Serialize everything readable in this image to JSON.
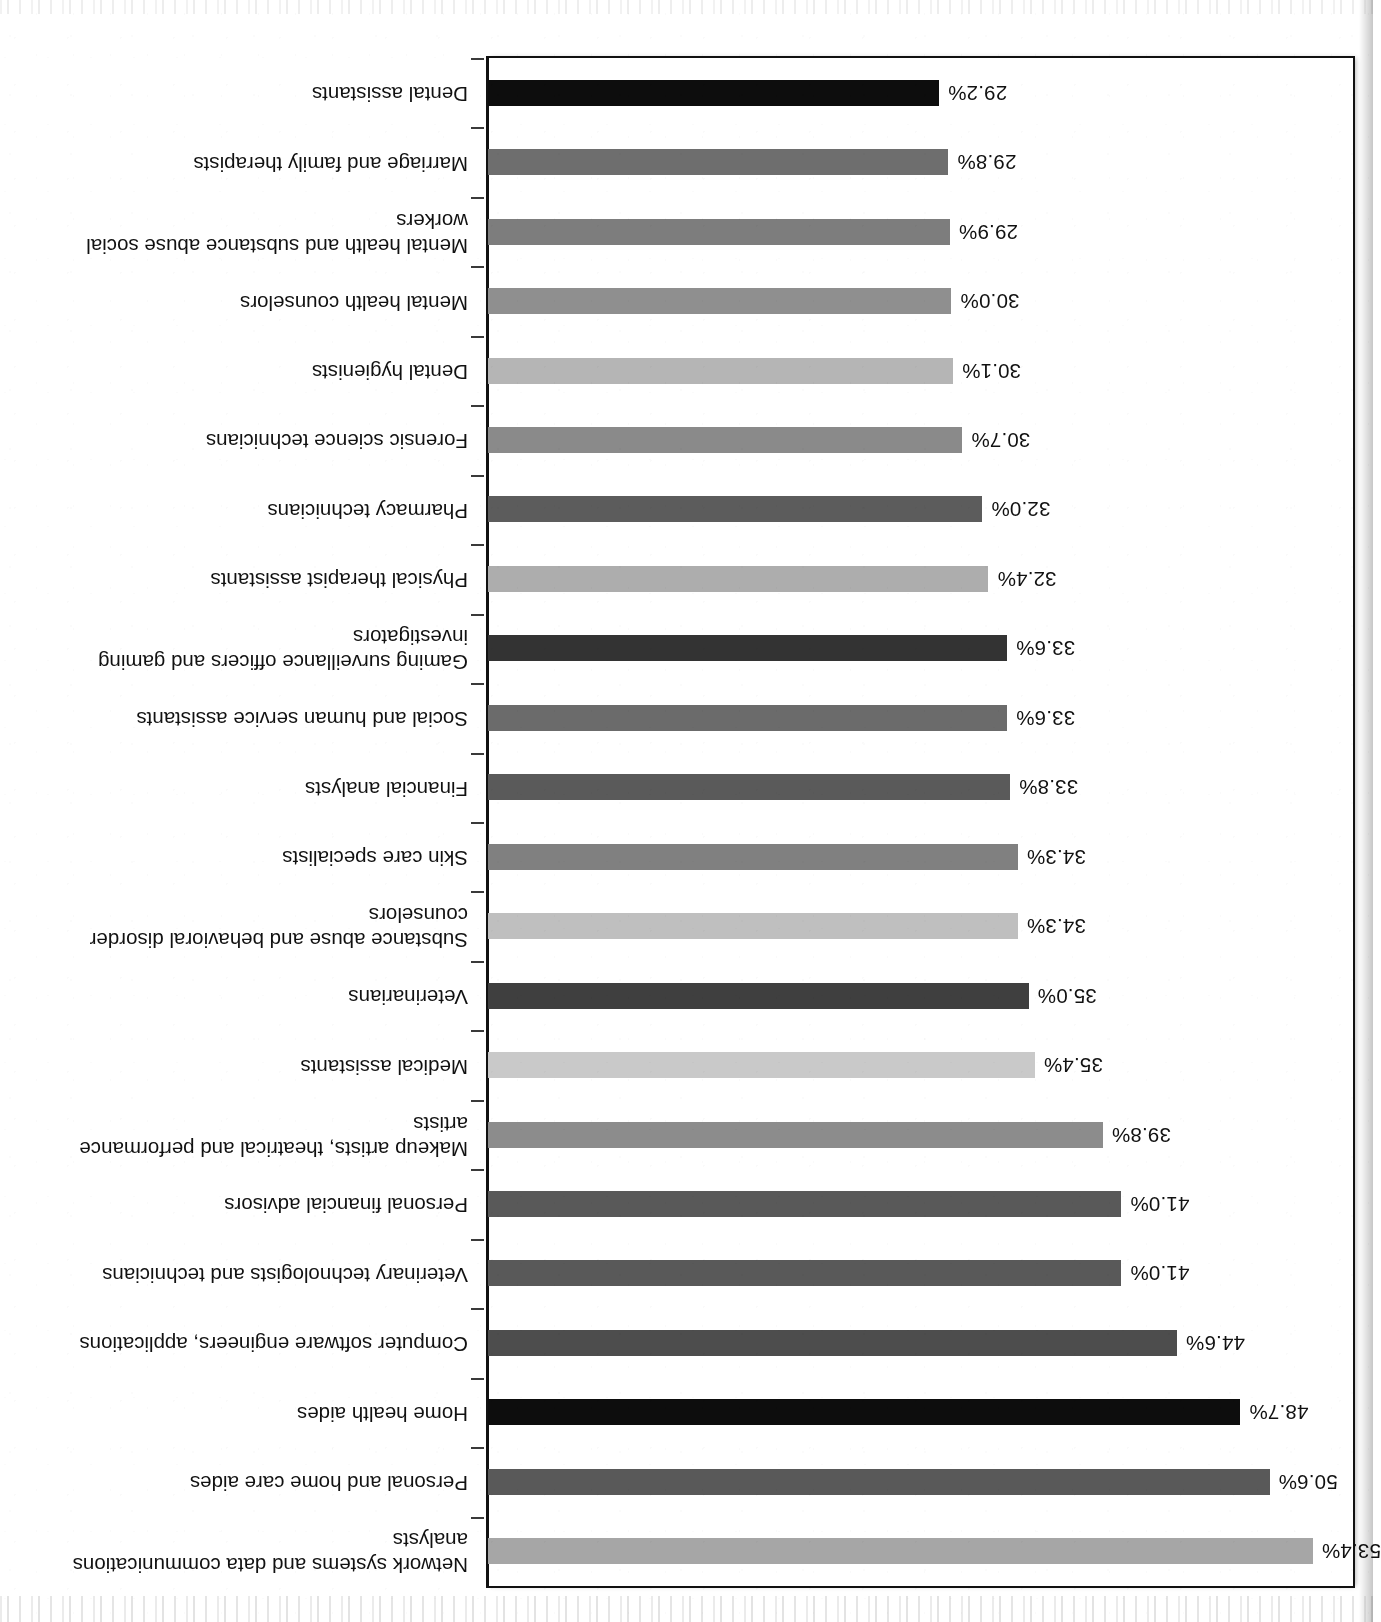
{
  "page": {
    "orientation_note": "upside-down-scan",
    "background": "#ffffff",
    "frame_color": "#111111",
    "axis_color": "#111111"
  },
  "chart_data": {
    "type": "bar",
    "orientation": "horizontal",
    "title": "",
    "subtitle": "",
    "xlabel": "",
    "ylabel": "",
    "xlim": [
      0,
      56
    ],
    "grid": false,
    "legend": "none",
    "value_suffix": "%",
    "categories": [
      "Network systems and data communications\nanalysts",
      "Personal and home care aides",
      "Home health aides",
      "Computer software engineers, applications",
      "Veterinary technologists and technicians",
      "Personal financial advisors",
      "Makeup artists, theatrical and performance\nartists",
      "Medical assistants",
      "Veterinarians",
      "Substance abuse and behavioral disorder\ncounselors",
      "Skin care specialists",
      "Financial analysts",
      "Social and human service assistants",
      "Gaming surveillance officers and gaming\ninvestigators",
      "Physical therapist assistants",
      "Pharmacy technicians",
      "Forensic science technicians",
      "Dental hygienists",
      "Mental health counselors",
      "Mental health and substance abuse social\nworkers",
      "Marriage and family therapists",
      "Dental assistants"
    ],
    "values": [
      53.4,
      50.6,
      48.7,
      44.6,
      41.0,
      41.0,
      39.8,
      35.4,
      35.0,
      34.3,
      34.3,
      33.8,
      33.6,
      33.6,
      32.4,
      32.0,
      30.7,
      30.1,
      30.0,
      29.9,
      29.8,
      29.2
    ],
    "value_labels": [
      "53.4%",
      "50.6%",
      "48.7%",
      "44.6%",
      "41.0%",
      "41.0%",
      "39.8%",
      "35.4%",
      "35.0%",
      "34.3%",
      "34.3%",
      "33.8%",
      "33.6%",
      "33.6%",
      "32.4%",
      "32.0%",
      "30.7%",
      "30.1%",
      "30.0%",
      "29.9%",
      "29.8%",
      "29.2%"
    ],
    "bar_colors": [
      "#a6a6a6",
      "#595959",
      "#0d0d0d",
      "#4d4d4d",
      "#595959",
      "#595959",
      "#8c8c8c",
      "#c9c9c9",
      "#3f3f3f",
      "#bfbfbf",
      "#808080",
      "#5a5a5a",
      "#6b6b6b",
      "#333333",
      "#adadad",
      "#5c5c5c",
      "#8a8a8a",
      "#b5b5b5",
      "#8f8f8f",
      "#7d7d7d",
      "#6e6e6e",
      "#0d0d0d"
    ]
  }
}
